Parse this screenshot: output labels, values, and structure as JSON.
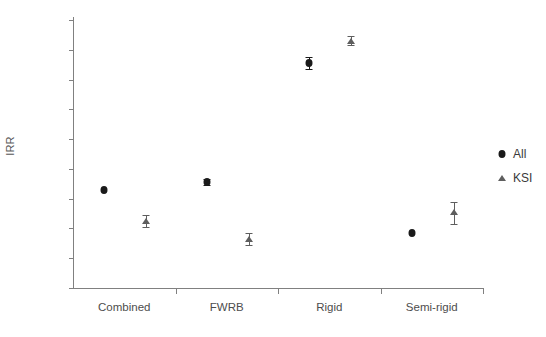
{
  "chart_data": {
    "type": "scatter",
    "title": "",
    "xlabel": "",
    "ylabel": "IRR",
    "categories": [
      "Combined",
      "FWRB",
      "Rigid",
      "Semi-rigid"
    ],
    "ylim": [
      0,
      0.9
    ],
    "yticks": [
      "0",
      "0.1",
      "0.2",
      "0.3",
      "0.4",
      "0.5",
      "0.6",
      "0.7",
      "0.8",
      "0.9"
    ],
    "ytick_values": [
      0,
      0.1,
      0.2,
      0.3,
      0.4,
      0.5,
      0.6,
      0.7,
      0.8,
      0.9
    ],
    "grid": false,
    "legend_position": "right",
    "series": [
      {
        "name": "All",
        "marker": "circle",
        "color": "#1a1a1a",
        "values": [
          0.33,
          0.355,
          0.755,
          0.185
        ],
        "err_low": [
          0.33,
          0.345,
          0.735,
          0.185
        ],
        "err_high": [
          0.33,
          0.365,
          0.775,
          0.185
        ]
      },
      {
        "name": "KSI",
        "marker": "triangle",
        "color": "#5e5e5e",
        "values": [
          0.225,
          0.165,
          0.83,
          0.255
        ],
        "err_low": [
          0.205,
          0.145,
          0.815,
          0.215
        ],
        "err_high": [
          0.245,
          0.185,
          0.845,
          0.29
        ]
      }
    ]
  },
  "legend": {
    "items": [
      {
        "label": "All",
        "marker": "circle"
      },
      {
        "label": "KSI",
        "marker": "triangle"
      }
    ]
  }
}
